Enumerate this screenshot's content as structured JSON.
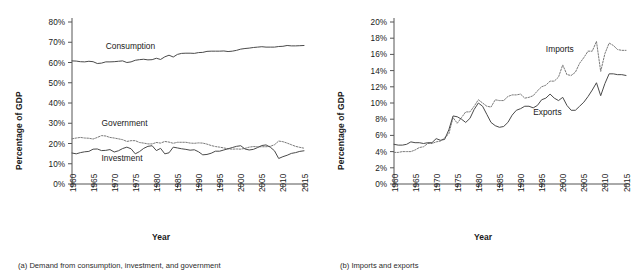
{
  "figure": {
    "panels": [
      {
        "id": "panel-a",
        "caption": "(a) Demand from consumption, investment, and government",
        "xlabel": "Year",
        "ylabel": "Percentage of GDP"
      },
      {
        "id": "panel-b",
        "caption": "(b) Imports and exports",
        "xlabel": "Year",
        "ylabel": "Percentage of GDP"
      }
    ]
  },
  "chart_data": [
    {
      "type": "line",
      "title": "(a) Demand from consumption, investment, and government",
      "xlabel": "Year",
      "ylabel": "Percentage of GDP",
      "xlim": [
        1960,
        2015
      ],
      "ylim": [
        0,
        80
      ],
      "ytick_labels": [
        "0%",
        "10%",
        "20%",
        "30%",
        "40%",
        "50%",
        "60%",
        "70%",
        "80%"
      ],
      "yticks": [
        0,
        10,
        20,
        30,
        40,
        50,
        60,
        70,
        80
      ],
      "xtick_labels": [
        "1960",
        "1965",
        "1970",
        "1975",
        "1980",
        "1985",
        "1990",
        "1995",
        "2000",
        "2005",
        "2010",
        "2015"
      ],
      "xticks": [
        1960,
        1965,
        1970,
        1975,
        1980,
        1985,
        1990,
        1995,
        2000,
        2005,
        2010,
        2015
      ],
      "grid": false,
      "legend_position": "inline-annotations",
      "annotations": [
        {
          "text": "Consumption",
          "x": 1968,
          "y": 66.5
        },
        {
          "text": "Government",
          "x": 1967,
          "y": 28.5
        },
        {
          "text": "Investment",
          "x": 1967,
          "y": 11.5
        }
      ],
      "x": [
        1960,
        1961,
        1962,
        1963,
        1964,
        1965,
        1966,
        1967,
        1968,
        1969,
        1970,
        1971,
        1972,
        1973,
        1974,
        1975,
        1976,
        1977,
        1978,
        1979,
        1980,
        1981,
        1982,
        1983,
        1984,
        1985,
        1986,
        1987,
        1988,
        1989,
        1990,
        1991,
        1992,
        1993,
        1994,
        1995,
        1996,
        1997,
        1998,
        1999,
        2000,
        2001,
        2002,
        2003,
        2004,
        2005,
        2006,
        2007,
        2008,
        2009,
        2010,
        2011,
        2012,
        2013,
        2014,
        2015
      ],
      "series": [
        {
          "name": "Consumption",
          "style": "solid",
          "values": [
            60.8,
            60.7,
            60.4,
            60.3,
            60.6,
            60.4,
            59.5,
            59.7,
            60.3,
            60.3,
            60.4,
            60.6,
            60.8,
            60.0,
            60.3,
            61.1,
            61.4,
            61.6,
            61.3,
            61.4,
            62.1,
            61.5,
            62.8,
            63.6,
            62.7,
            64.0,
            64.5,
            64.6,
            64.6,
            64.5,
            64.9,
            65.0,
            65.5,
            65.6,
            65.6,
            65.6,
            65.7,
            65.4,
            65.6,
            66.0,
            66.6,
            66.9,
            67.1,
            67.4,
            67.6,
            67.8,
            67.6,
            67.6,
            67.6,
            67.9,
            68.0,
            68.4,
            68.2,
            68.2,
            68.3,
            68.4
          ]
        },
        {
          "name": "Government",
          "style": "dotted",
          "values": [
            22.3,
            22.7,
            23.0,
            22.7,
            22.6,
            22.2,
            23.0,
            23.9,
            23.7,
            23.0,
            22.7,
            22.3,
            21.9,
            21.0,
            21.4,
            21.4,
            20.5,
            20.2,
            19.8,
            19.8,
            20.5,
            20.2,
            21.0,
            20.7,
            20.1,
            20.6,
            20.6,
            20.6,
            20.2,
            20.1,
            20.3,
            20.2,
            19.7,
            19.0,
            18.5,
            18.2,
            17.8,
            17.4,
            17.2,
            17.3,
            17.2,
            17.6,
            18.2,
            18.5,
            18.4,
            18.4,
            18.4,
            18.6,
            19.4,
            21.2,
            20.9,
            20.2,
            19.4,
            18.6,
            18.1,
            17.7
          ]
        },
        {
          "name": "Investment",
          "style": "solid",
          "values": [
            15.3,
            14.9,
            15.5,
            15.9,
            16.1,
            17.2,
            17.3,
            16.5,
            16.6,
            17.0,
            15.8,
            16.4,
            17.5,
            18.2,
            17.4,
            14.9,
            16.0,
            17.6,
            18.6,
            18.9,
            16.5,
            17.6,
            14.9,
            15.4,
            18.2,
            17.8,
            17.4,
            17.1,
            16.7,
            16.9,
            15.9,
            14.4,
            14.6,
            15.2,
            16.2,
            16.2,
            16.8,
            17.4,
            18.0,
            18.6,
            18.9,
            17.3,
            16.8,
            17.1,
            18.0,
            19.0,
            19.3,
            18.2,
            16.4,
            12.6,
            13.5,
            14.2,
            15.1,
            15.5,
            16.1,
            16.4
          ]
        }
      ]
    },
    {
      "type": "line",
      "title": "(b) Imports and exports",
      "xlabel": "Year",
      "ylabel": "Percentage of GDP",
      "xlim": [
        1960,
        2015
      ],
      "ylim": [
        0,
        20
      ],
      "ytick_labels": [
        "0%",
        "2%",
        "4%",
        "6%",
        "8%",
        "10%",
        "12%",
        "14%",
        "16%",
        "18%",
        "20%"
      ],
      "yticks": [
        0,
        2,
        4,
        6,
        8,
        10,
        12,
        14,
        16,
        18,
        20
      ],
      "xtick_labels": [
        "1960",
        "1965",
        "1970",
        "1975",
        "1980",
        "1985",
        "1990",
        "1995",
        "2000",
        "2005",
        "2010",
        "2015"
      ],
      "xticks": [
        1960,
        1965,
        1970,
        1975,
        1980,
        1985,
        1990,
        1995,
        2000,
        2005,
        2010,
        2015
      ],
      "grid": false,
      "legend_position": "inline-annotations",
      "annotations": [
        {
          "text": "Imports",
          "x": 1996,
          "y": 16.3
        },
        {
          "text": "Exports",
          "x": 1993,
          "y": 8.5
        }
      ],
      "x": [
        1960,
        1961,
        1962,
        1963,
        1964,
        1965,
        1966,
        1967,
        1968,
        1969,
        1970,
        1971,
        1972,
        1973,
        1974,
        1975,
        1976,
        1977,
        1978,
        1979,
        1980,
        1981,
        1982,
        1983,
        1984,
        1985,
        1986,
        1987,
        1988,
        1989,
        1990,
        1991,
        1992,
        1993,
        1994,
        1995,
        1996,
        1997,
        1998,
        1999,
        2000,
        2001,
        2002,
        2003,
        2004,
        2005,
        2006,
        2007,
        2008,
        2009,
        2010,
        2011,
        2012,
        2013,
        2014,
        2015
      ],
      "series": [
        {
          "name": "Imports",
          "style": "dotted",
          "values": [
            3.9,
            3.9,
            4.0,
            4.0,
            4.0,
            4.2,
            4.5,
            4.6,
            5.0,
            5.0,
            5.2,
            5.3,
            5.7,
            6.2,
            8.2,
            7.5,
            8.2,
            8.9,
            8.9,
            9.6,
            10.4,
            10.0,
            9.6,
            9.5,
            10.4,
            10.3,
            10.3,
            10.8,
            11.0,
            11.0,
            11.1,
            10.6,
            10.7,
            10.9,
            11.5,
            12.0,
            12.2,
            12.7,
            12.7,
            13.2,
            14.7,
            13.5,
            13.4,
            13.8,
            14.9,
            15.6,
            16.4,
            16.4,
            17.6,
            13.9,
            16.1,
            17.4,
            17.1,
            16.6,
            16.5,
            16.5
          ]
        },
        {
          "name": "Exports",
          "style": "solid",
          "values": [
            4.9,
            4.8,
            4.8,
            4.9,
            5.2,
            5.1,
            5.1,
            5.0,
            5.1,
            5.1,
            5.6,
            5.4,
            5.5,
            6.7,
            8.4,
            8.3,
            8.0,
            7.6,
            8.1,
            9.2,
            10.0,
            9.6,
            8.6,
            7.6,
            7.2,
            7.0,
            7.1,
            7.6,
            8.5,
            9.1,
            9.3,
            9.6,
            9.6,
            9.4,
            9.7,
            10.4,
            10.6,
            11.1,
            10.6,
            10.3,
            10.7,
            9.7,
            9.1,
            9.1,
            9.6,
            10.1,
            10.8,
            11.6,
            12.5,
            10.9,
            12.4,
            13.6,
            13.6,
            13.5,
            13.5,
            13.4
          ]
        }
      ]
    }
  ]
}
